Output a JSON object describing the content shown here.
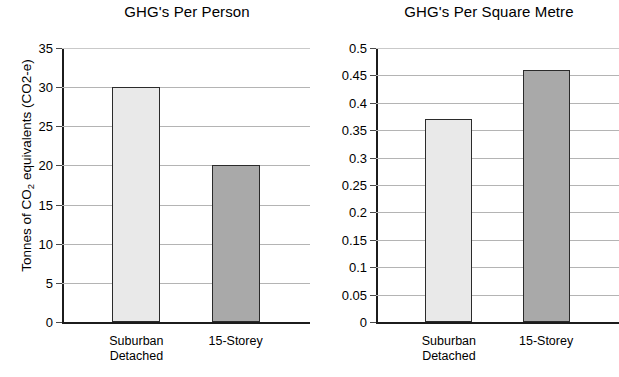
{
  "chart_data": [
    {
      "type": "bar",
      "title": "GHG's Per Person",
      "xlabel": "",
      "ylabel": "Tonnes of CO2 equivalents (CO2-e)",
      "ylabel_parts": {
        "pre": "Tonnes of CO",
        "sub": "2",
        "post": " equivalents (CO2-e)"
      },
      "categories": [
        "Suburban Detached",
        "15-Storey"
      ],
      "category_lines": [
        [
          "Suburban",
          "Detached"
        ],
        [
          "15-Storey"
        ]
      ],
      "values": [
        30,
        20.1
      ],
      "ylim": [
        0,
        35
      ],
      "ytick_step": 5,
      "yticks": [
        0,
        5,
        10,
        15,
        20,
        25,
        30,
        35
      ],
      "ytick_labels": [
        "0",
        "5",
        "10",
        "15",
        "20",
        "25",
        "30",
        "35"
      ],
      "bar_colors": [
        "#e9e9e9",
        "#a9a9a9"
      ],
      "bar_edge_color": "#2b2b2b",
      "grid": true,
      "legend": "none"
    },
    {
      "type": "bar",
      "title": "GHG's Per Square Metre",
      "xlabel": "",
      "ylabel": "",
      "categories": [
        "Suburban Detached",
        "15-Storey"
      ],
      "category_lines": [
        [
          "Suburban",
          "Detached"
        ],
        [
          "15-Storey"
        ]
      ],
      "values": [
        0.37,
        0.46
      ],
      "ylim": [
        0,
        0.5
      ],
      "ytick_step": 0.05,
      "yticks": [
        0,
        0.05,
        0.1,
        0.15,
        0.2,
        0.25,
        0.3,
        0.35,
        0.4,
        0.45,
        0.5
      ],
      "ytick_labels": [
        "0",
        "0.05",
        "0.1",
        "0.15",
        "0.2",
        "0.25",
        "0.3",
        "0.35",
        "0.4",
        "0.45",
        "0.5"
      ],
      "bar_colors": [
        "#e9e9e9",
        "#a9a9a9"
      ],
      "bar_edge_color": "#2b2b2b",
      "grid": true,
      "legend": "none"
    }
  ],
  "colors": {
    "axis": "#1c1c1c",
    "gridline": "#b4b4b4",
    "light_bar": "#e9e9e9",
    "dark_bar": "#a9a9a9",
    "text": "#000000"
  }
}
